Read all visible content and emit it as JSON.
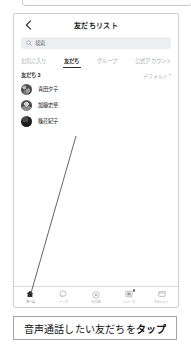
{
  "header": {
    "title": "友だちリスト",
    "back_icon": "chevron-left-icon"
  },
  "search": {
    "placeholder": "検索",
    "value": "",
    "icon": "search-icon"
  },
  "tabs": [
    {
      "label": "お気に入り",
      "active": false
    },
    {
      "label": "友だち",
      "active": true
    },
    {
      "label": "グループ",
      "active": false
    },
    {
      "label": "公式アカウント",
      "active": false
    }
  ],
  "list_section": {
    "count_label": "友だち 3",
    "sort_label": "デフォルト",
    "sort_caret": "▾"
  },
  "friends": [
    {
      "name": "青田夕子",
      "avatar": "avatar-photo"
    },
    {
      "name": "加藤史華",
      "avatar": "avatar-photo"
    },
    {
      "name": "篠花紀子",
      "avatar": "avatar-photo"
    }
  ],
  "bottom_nav": [
    {
      "label": "ホーム",
      "icon": "home-icon",
      "active": true,
      "badge": false
    },
    {
      "label": "トーク",
      "icon": "chat-icon",
      "active": false,
      "badge": false
    },
    {
      "label": "VOOM",
      "icon": "play-icon",
      "active": false,
      "badge": false
    },
    {
      "label": "ニュース",
      "icon": "news-icon",
      "active": false,
      "badge": true
    },
    {
      "label": "ウォレット",
      "icon": "wallet-icon",
      "active": false,
      "badge": false
    }
  ],
  "caption": {
    "text_before": "音声通話したい友だちを",
    "text_emphasis": "タップ"
  },
  "colors": {
    "text_primary": "#1b1b1b",
    "text_muted": "#a9aeb4",
    "search_bg": "#eceef0",
    "card_border": "#c8ccd1",
    "active_underline": "#2d2d2d"
  }
}
